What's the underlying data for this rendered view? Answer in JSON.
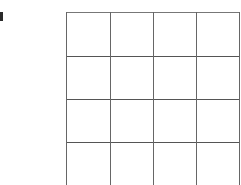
{
  "grid": {
    "rows": 4,
    "cols": 4,
    "line_color": "#555555",
    "cells": [
      [
        "",
        "",
        "",
        ""
      ],
      [
        "",
        "",
        "",
        ""
      ],
      [
        "",
        "",
        "",
        ""
      ],
      [
        "",
        "",
        "",
        ""
      ]
    ]
  },
  "left_marker": {
    "color": "#2a2a2a"
  }
}
